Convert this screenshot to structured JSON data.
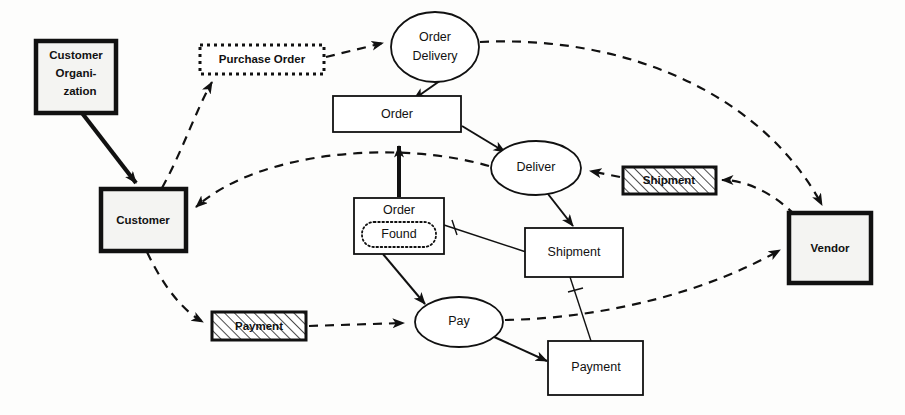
{
  "diagram": {
    "background_color": "#fdfdfc",
    "line_color": "#111111",
    "node_fill": "#f4f4f2",
    "nodes": {
      "customer_organization": {
        "label_line1": "Customer",
        "label_line2": "Organi-",
        "label_line3": "zation",
        "shape": "thick-rect",
        "x": 36,
        "y": 41,
        "w": 80,
        "h": 72
      },
      "customer": {
        "label": "Customer",
        "shape": "thick-rect",
        "x": 101,
        "y": 189,
        "w": 85,
        "h": 62
      },
      "vendor": {
        "label": "Vendor",
        "shape": "thick-rect",
        "x": 789,
        "y": 213,
        "w": 82,
        "h": 70
      },
      "purchase_order": {
        "label": "Purchase Order",
        "shape": "dotted-rect",
        "x": 200,
        "y": 45,
        "w": 124,
        "h": 29
      },
      "shipment_flow": {
        "label": "Shipment",
        "shape": "hatched-rect",
        "x": 623,
        "y": 167,
        "w": 93,
        "h": 27
      },
      "payment_flow": {
        "label": "Payment",
        "shape": "hatched-rect",
        "x": 212,
        "y": 312,
        "w": 94,
        "h": 28
      },
      "order_delivery": {
        "label_line1": "Order",
        "label_line2": "Delivery",
        "shape": "ellipse",
        "cx": 435,
        "cy": 47,
        "rx": 44,
        "ry": 35
      },
      "deliver": {
        "label": "Deliver",
        "shape": "ellipse",
        "cx": 536,
        "cy": 168,
        "rx": 45,
        "ry": 27
      },
      "pay": {
        "label": "Pay",
        "shape": "ellipse",
        "cx": 459,
        "cy": 322,
        "rx": 44,
        "ry": 25
      },
      "order": {
        "label": "Order",
        "shape": "rect",
        "x": 333,
        "y": 96,
        "w": 128,
        "h": 36
      },
      "order_found": {
        "label_outer": "Order",
        "label_inner": "Found",
        "shape": "rect-with-dotted-inner",
        "x": 354,
        "y": 198,
        "w": 90,
        "h": 56
      },
      "shipment_entity": {
        "label": "Shipment",
        "shape": "rect",
        "x": 525,
        "y": 228,
        "w": 98,
        "h": 49
      },
      "payment_entity": {
        "label": "Payment",
        "shape": "rect",
        "x": 548,
        "y": 341,
        "w": 95,
        "h": 54
      }
    },
    "edges": [
      {
        "name": "customer-organization-to-customer",
        "from": "customer_organization",
        "to": "customer",
        "style": "solid-thick-arrow"
      },
      {
        "name": "customer-to-purchase-order",
        "from": "customer",
        "to": "purchase_order",
        "style": "dashed-arrow"
      },
      {
        "name": "purchase-order-to-order-delivery",
        "from": "purchase_order",
        "to": "order_delivery",
        "style": "dashed-arrow"
      },
      {
        "name": "order-delivery-to-order",
        "from": "order_delivery",
        "to": "order",
        "style": "solid-arrow"
      },
      {
        "name": "order-delivery-to-vendor",
        "from": "order_delivery",
        "to": "vendor",
        "style": "dashed-arrow"
      },
      {
        "name": "order-to-deliver",
        "from": "order",
        "to": "deliver",
        "style": "solid-arrow"
      },
      {
        "name": "deliver-to-customer",
        "from": "deliver",
        "to": "customer",
        "style": "dashed-arrow"
      },
      {
        "name": "shipment-flow-to-deliver",
        "from": "shipment_flow",
        "to": "deliver",
        "style": "dashed-arrow"
      },
      {
        "name": "vendor-to-shipment-flow",
        "from": "vendor",
        "to": "shipment_flow",
        "style": "dashed-arrow"
      },
      {
        "name": "deliver-to-shipment-entity",
        "from": "deliver",
        "to": "shipment_entity",
        "style": "solid-arrow"
      },
      {
        "name": "order-found-to-order",
        "from": "order_found",
        "to": "order",
        "style": "solid-thick-arrow"
      },
      {
        "name": "order-found-to-shipment-entity",
        "from": "order_found",
        "to": "shipment_entity",
        "style": "solid-line-tick"
      },
      {
        "name": "order-found-to-pay",
        "from": "order_found",
        "to": "pay",
        "style": "solid-arrow"
      },
      {
        "name": "customer-to-payment-flow",
        "from": "customer",
        "to": "payment_flow",
        "style": "dashed-arrow"
      },
      {
        "name": "payment-flow-to-pay",
        "from": "payment_flow",
        "to": "pay",
        "style": "dashed-arrow"
      },
      {
        "name": "pay-to-vendor",
        "from": "pay",
        "to": "vendor",
        "style": "dashed-arrow"
      },
      {
        "name": "pay-to-payment-entity",
        "from": "pay",
        "to": "payment_entity",
        "style": "solid-arrow"
      },
      {
        "name": "shipment-entity-to-payment-entity",
        "from": "shipment_entity",
        "to": "payment_entity",
        "style": "solid-line-tick"
      }
    ]
  }
}
